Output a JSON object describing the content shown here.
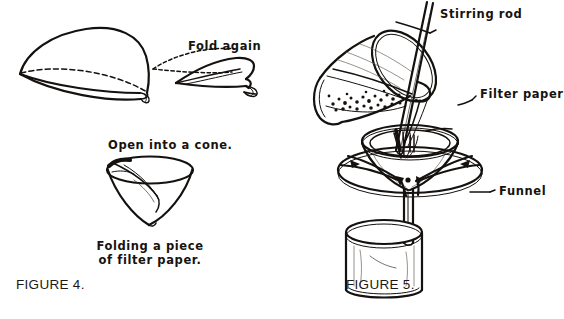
{
  "document": {
    "kind": "textbook-line-art-illustration",
    "background_color": "#ffffff",
    "ink_color": "#14110f"
  },
  "figure4": {
    "id": "FIGURE 4.",
    "figure_label": "FIGURE 4.",
    "steps": [
      {
        "name": "half-fold",
        "caption": ""
      },
      {
        "name": "quarter-fold",
        "caption": "Fold again"
      },
      {
        "name": "open-cone",
        "caption": "Open into a cone."
      }
    ],
    "labels": {
      "fold_again": "Fold again",
      "open_into_cone": "Open into a cone.",
      "caption_line1": "Folding a piece",
      "caption_line2": "of filter paper."
    }
  },
  "figure5": {
    "id": "FIGURE 5.",
    "figure_label": "FIGURE 5.",
    "scene": "filtration-setup",
    "labels": {
      "stirring_rod": "Stirring rod",
      "filter_paper": "Filter paper",
      "funnel": "Funnel"
    },
    "components": [
      {
        "name": "beaker-pouring",
        "detail": "tilted beaker containing dark granular precipitate and liquid"
      },
      {
        "name": "stirring-rod",
        "detail": "glass rod guiding the pour"
      },
      {
        "name": "filter-paper-cone",
        "detail": "folded paper cone seated in funnel"
      },
      {
        "name": "funnel",
        "detail": "funnel supported on iron ring with clay triangle"
      },
      {
        "name": "support-ring",
        "detail": "iron ring with clay triangle"
      },
      {
        "name": "receiving-beaker",
        "detail": "beaker collecting filtrate below funnel stem"
      }
    ]
  }
}
